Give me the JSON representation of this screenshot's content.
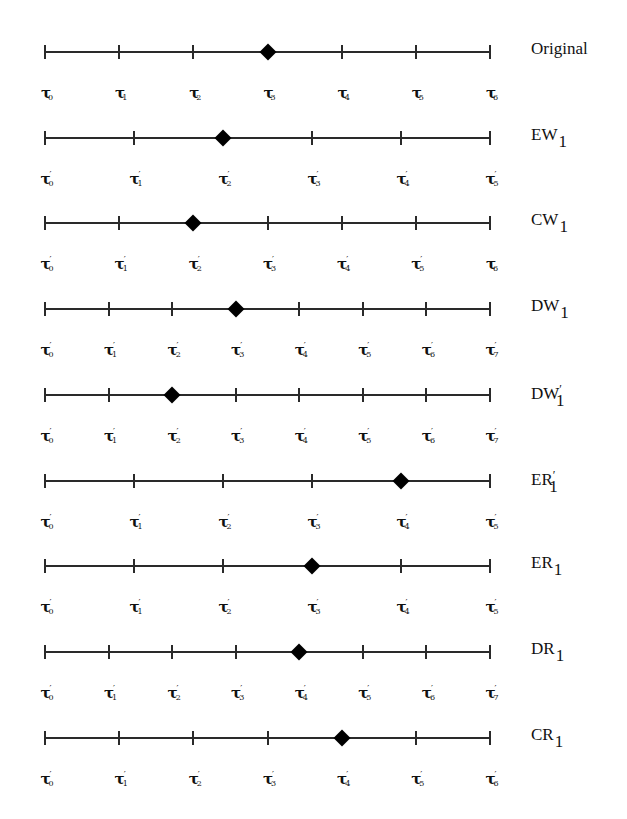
{
  "diagram": {
    "line_start_x": 45,
    "line_end_x": 490,
    "colors": {
      "line": "#2a2a2a",
      "marker": "#000000",
      "text": "#111111",
      "background": "#ffffff"
    },
    "rows": [
      {
        "name": "Original",
        "label_base": "Original",
        "label_prime": "",
        "label_sub": "",
        "y": 51,
        "ticks": 7,
        "marker_index": 3,
        "tick_labels": [
          {
            "p": false,
            "s": "0"
          },
          {
            "p": false,
            "s": "1"
          },
          {
            "p": false,
            "s": "2"
          },
          {
            "p": false,
            "s": "3"
          },
          {
            "p": false,
            "s": "4"
          },
          {
            "p": false,
            "s": "5"
          },
          {
            "p": false,
            "s": "6"
          }
        ]
      },
      {
        "name": "EW1",
        "label_base": "EW",
        "label_prime": "",
        "label_sub": "1",
        "y": 137,
        "ticks": 6,
        "marker_index": 2,
        "tick_labels": [
          {
            "p": true,
            "s": "0"
          },
          {
            "p": true,
            "s": "1"
          },
          {
            "p": true,
            "s": "2"
          },
          {
            "p": true,
            "s": "3"
          },
          {
            "p": true,
            "s": "4"
          },
          {
            "p": true,
            "s": "5"
          }
        ]
      },
      {
        "name": "CW1",
        "label_base": "CW",
        "label_prime": "",
        "label_sub": "1",
        "y": 222,
        "ticks": 7,
        "marker_index": 2,
        "tick_labels": [
          {
            "p": true,
            "s": "0"
          },
          {
            "p": true,
            "s": "1"
          },
          {
            "p": true,
            "s": "2"
          },
          {
            "p": true,
            "s": "3"
          },
          {
            "p": true,
            "s": "4"
          },
          {
            "p": true,
            "s": "5"
          },
          {
            "p": false,
            "s": "6"
          }
        ]
      },
      {
        "name": "DW1",
        "label_base": "DW",
        "label_prime": "",
        "label_sub": "1",
        "y": 308,
        "ticks": 8,
        "marker_index": 3,
        "tick_labels": [
          {
            "p": true,
            "s": "0"
          },
          {
            "p": true,
            "s": "1"
          },
          {
            "p": true,
            "s": "2"
          },
          {
            "p": true,
            "s": "3"
          },
          {
            "p": true,
            "s": "4"
          },
          {
            "p": true,
            "s": "5"
          },
          {
            "p": true,
            "s": "6"
          },
          {
            "p": true,
            "s": "7"
          }
        ]
      },
      {
        "name": "DW'1",
        "label_base": "DW",
        "label_prime": "′",
        "label_sub": "1",
        "y": 394,
        "ticks": 8,
        "marker_index": 2,
        "tick_labels": [
          {
            "p": true,
            "s": "0"
          },
          {
            "p": true,
            "s": "1"
          },
          {
            "p": true,
            "s": "2"
          },
          {
            "p": true,
            "s": "3"
          },
          {
            "p": true,
            "s": "4"
          },
          {
            "p": true,
            "s": "5"
          },
          {
            "p": true,
            "s": "6"
          },
          {
            "p": true,
            "s": "7"
          }
        ]
      },
      {
        "name": "ER'1",
        "label_base": "ER",
        "label_prime": "′",
        "label_sub": "1",
        "y": 480,
        "ticks": 6,
        "marker_index": 4,
        "tick_labels": [
          {
            "p": true,
            "s": "0"
          },
          {
            "p": true,
            "s": "1"
          },
          {
            "p": true,
            "s": "2"
          },
          {
            "p": true,
            "s": "3"
          },
          {
            "p": true,
            "s": "4"
          },
          {
            "p": true,
            "s": "5"
          }
        ]
      },
      {
        "name": "ER1",
        "label_base": "ER",
        "label_prime": "",
        "label_sub": "1",
        "y": 565,
        "ticks": 6,
        "marker_index": 3,
        "tick_labels": [
          {
            "p": true,
            "s": "0"
          },
          {
            "p": true,
            "s": "1"
          },
          {
            "p": true,
            "s": "2"
          },
          {
            "p": true,
            "s": "3"
          },
          {
            "p": true,
            "s": "4"
          },
          {
            "p": true,
            "s": "5"
          }
        ]
      },
      {
        "name": "DR1",
        "label_base": "DR",
        "label_prime": "",
        "label_sub": "1",
        "y": 651,
        "ticks": 8,
        "marker_index": 4,
        "tick_labels": [
          {
            "p": true,
            "s": "0"
          },
          {
            "p": true,
            "s": "1"
          },
          {
            "p": true,
            "s": "2"
          },
          {
            "p": true,
            "s": "3"
          },
          {
            "p": true,
            "s": "4"
          },
          {
            "p": true,
            "s": "5"
          },
          {
            "p": true,
            "s": "6"
          },
          {
            "p": true,
            "s": "7"
          }
        ]
      },
      {
        "name": "CR1",
        "label_base": "CR",
        "label_prime": "",
        "label_sub": "1",
        "y": 737,
        "ticks": 7,
        "marker_index": 4,
        "tick_labels": [
          {
            "p": true,
            "s": "0"
          },
          {
            "p": true,
            "s": "1"
          },
          {
            "p": true,
            "s": "2"
          },
          {
            "p": true,
            "s": "3"
          },
          {
            "p": true,
            "s": "4"
          },
          {
            "p": true,
            "s": "5"
          },
          {
            "p": true,
            "s": "6"
          }
        ]
      }
    ],
    "symbols": {
      "tau": "τ",
      "prime": "′"
    }
  }
}
